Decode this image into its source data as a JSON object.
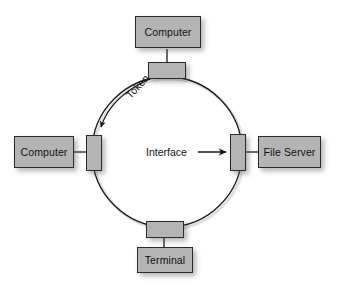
{
  "diagram": {
    "type": "token-ring-network",
    "background_color": "#ffffff",
    "box_fill_color": "#b4b4b4",
    "box_border_color": "#2b2b2b",
    "ring_stroke_color": "#1a1a1a",
    "text_color": "#101010"
  },
  "ring": {
    "center_x": 167,
    "center_y": 152,
    "radius": 75
  },
  "nodes": [
    {
      "id": "computer-top",
      "label": "Computer",
      "position": "top"
    },
    {
      "id": "computer-left",
      "label": "Computer",
      "position": "left"
    },
    {
      "id": "file-server",
      "label": "File Server",
      "position": "right"
    },
    {
      "id": "terminal",
      "label": "Terminal",
      "position": "bottom"
    }
  ],
  "interfaces": [
    {
      "id": "interface-top",
      "orientation": "horizontal"
    },
    {
      "id": "interface-left",
      "orientation": "vertical"
    },
    {
      "id": "interface-right",
      "orientation": "vertical"
    },
    {
      "id": "interface-bottom",
      "orientation": "horizontal"
    }
  ],
  "annotations": {
    "token": {
      "label": "Token",
      "arrow": "curved",
      "direction": "counterclockwise",
      "rotation_deg": -47
    },
    "interface": {
      "label": "Interface",
      "arrow": "straight",
      "direction": "right",
      "points_to": "interface-right"
    }
  }
}
